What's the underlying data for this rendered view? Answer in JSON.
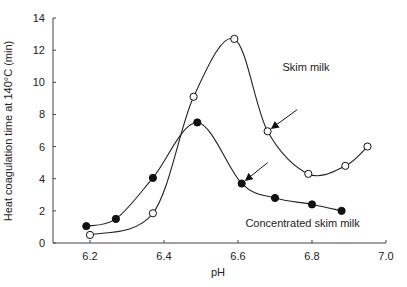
{
  "chart_data": {
    "type": "line",
    "title": "",
    "xlabel": "pH",
    "ylabel": "Heat coagulation time at 140°C (min)",
    "xlim": [
      6.1,
      7.0
    ],
    "ylim": [
      0,
      14
    ],
    "x_ticks": [
      "6.2",
      "6.4",
      "6.6",
      "6.8",
      "7.0"
    ],
    "x_tick_values": [
      6.2,
      6.4,
      6.6,
      6.8,
      7.0
    ],
    "y_ticks": [
      "0",
      "2",
      "4",
      "6",
      "8",
      "10",
      "12",
      "14"
    ],
    "y_tick_values": [
      0,
      2,
      4,
      6,
      8,
      10,
      12,
      14
    ],
    "grid": false,
    "legend": "none (direct labels)",
    "series": [
      {
        "name": "Skim milk",
        "marker": "open-circle",
        "x": [
          6.2,
          6.37,
          6.48,
          6.59,
          6.68,
          6.79,
          6.89,
          6.95
        ],
        "y": [
          0.5,
          1.85,
          9.1,
          12.7,
          6.95,
          4.3,
          4.8,
          6.0
        ]
      },
      {
        "name": "Concentrated skim milk",
        "marker": "filled-circle",
        "x": [
          6.19,
          6.27,
          6.37,
          6.49,
          6.61,
          6.7,
          6.8,
          6.88
        ],
        "y": [
          1.05,
          1.5,
          4.05,
          7.5,
          3.7,
          2.8,
          2.4,
          2.0
        ]
      }
    ],
    "annotations": [
      {
        "text": "Skim milk",
        "x": 6.72,
        "y": 10.7
      },
      {
        "text": "Concentrated skim milk",
        "x": 6.62,
        "y": 1.0
      },
      {
        "type": "arrow",
        "points_to": {
          "x": 6.68,
          "y": 6.95
        },
        "from": {
          "x": 6.76,
          "y": 8.3
        }
      },
      {
        "type": "arrow",
        "points_to": {
          "x": 6.61,
          "y": 3.7
        },
        "from": {
          "x": 6.68,
          "y": 5.0
        }
      }
    ]
  }
}
